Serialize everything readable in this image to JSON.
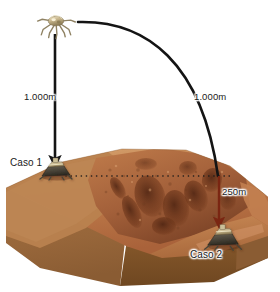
{
  "diagram": {
    "background_color": "#ffffff"
  },
  "terrain": {
    "name": "mars-terrain-block",
    "top_surface_color": "#c07a4a",
    "rock_color": "#b06a3c",
    "shadow_color": "#5d2e18",
    "side_face_color": "#9a6b3c",
    "front_face_color": "#7d5228",
    "highlight_color": "#d9a070"
  },
  "trajectories": {
    "vertical_drop": {
      "name": "vertical-drop-arrow",
      "color": "#141414",
      "label": "1.000m"
    },
    "parabolic_arc": {
      "name": "parabolic-arc",
      "color": "#141414",
      "label": "1.000m"
    },
    "extra_fall": {
      "name": "extra-fall-arrow",
      "color": "#7a2612",
      "label": "250m"
    },
    "reference_line": {
      "name": "dotted-reference-line",
      "color": "#1b1b1b",
      "style": "dotted"
    }
  },
  "landers": {
    "top": {
      "name": "lander-top",
      "label": ""
    },
    "case1": {
      "name": "lander-caso-1",
      "label": "Caso 1"
    },
    "case2": {
      "name": "lander-caso-2",
      "label": "Caso 2"
    }
  },
  "labels": {
    "drop_left": "1.000m",
    "drop_right": "1.000m",
    "drop_second": "250m",
    "caso1": "Caso 1",
    "caso2": "Caso 2"
  }
}
